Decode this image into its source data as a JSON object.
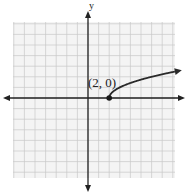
{
  "chart_data": {
    "type": "line",
    "title": "",
    "xlabel": "",
    "ylabel": "y",
    "xlim": [
      -7,
      8
    ],
    "ylim": [
      -7.5,
      7
    ],
    "grid": true,
    "function": "y = sqrt(x - 2)",
    "series": [
      {
        "name": "y = sqrt(x - 2)",
        "x": [
          2,
          2.25,
          3,
          4,
          5,
          6,
          7,
          8,
          8.4
        ],
        "y": [
          0,
          0.5,
          1,
          1.41,
          1.73,
          2,
          2.24,
          2.45,
          2.53
        ],
        "start_point_marked": true,
        "end_arrow": true
      }
    ],
    "annotations": [
      {
        "text": "(2, 0)",
        "x": 2,
        "y": 0
      }
    ],
    "colors": {
      "axis": "#222222",
      "grid": "#c8c8c8",
      "curve": "#2a2a2a",
      "background": "#f4f4f4"
    }
  },
  "labels": {
    "y_axis": "y",
    "point": "(2, 0)"
  }
}
